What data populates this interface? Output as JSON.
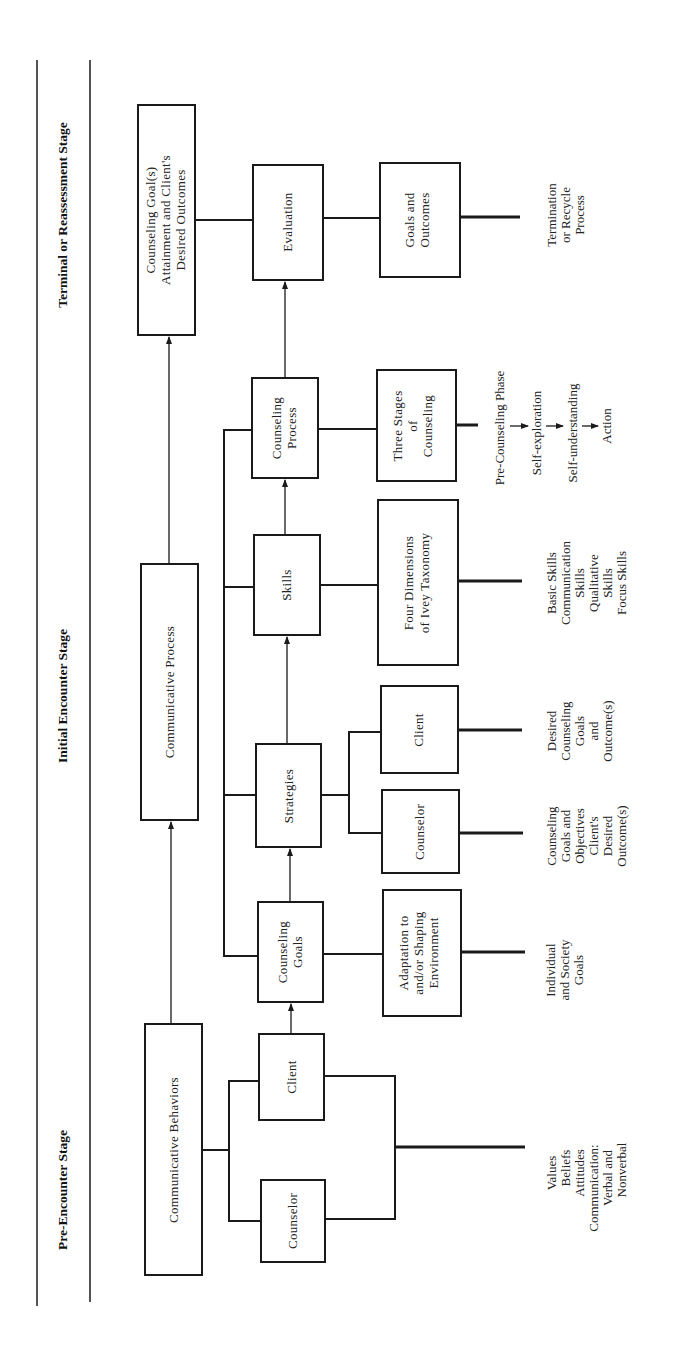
{
  "stages": {
    "pre_encounter": "Pre-Encounter Stage",
    "initial_encounter": "Initial Encounter Stage",
    "terminal": "Terminal or Reassessment Stage"
  },
  "boxes": {
    "communicative_behaviors": [
      "Communicative Behaviors"
    ],
    "pre_counselor": [
      "Counselor"
    ],
    "pre_client": [
      "Client"
    ],
    "communicative_process": [
      "Communicative Process"
    ],
    "counseling_goals": [
      "Counseling",
      "Goals"
    ],
    "adaptation": [
      "Adaptation to",
      "and/or Shaping",
      "Environment"
    ],
    "strategies": [
      "Strategies"
    ],
    "strat_counselor": [
      "Counselor"
    ],
    "strat_client": [
      "Client"
    ],
    "skills": [
      "Skills"
    ],
    "four_dimensions": [
      "Four Dimensions",
      "of Ivey Taxonomy"
    ],
    "counseling_process": [
      "Counseling",
      "Process"
    ],
    "three_stages": [
      "Three Stages",
      "of",
      "Counseling"
    ],
    "goal_attainment": [
      "Counseling Goal(s)",
      "Attainment and Client's",
      "Desired Outcomes"
    ],
    "evaluation": [
      "Evaluation"
    ],
    "goals_outcomes": [
      "Goals and",
      "Outcomes"
    ]
  },
  "outputs": {
    "pre": [
      "Values",
      "Beliefs",
      "Attitudes",
      "Communication:",
      "Verbal and",
      "Nonverbal"
    ],
    "goals": [
      "Individual",
      "and Society",
      "Goals"
    ],
    "strat_counselor": [
      "Counseling",
      "Goals and",
      "Objectives",
      "Client's",
      "Desired",
      "Outcome(s)"
    ],
    "strat_client": [
      "Desired",
      "Counseling",
      "Goals",
      "and",
      "Outcome(s)"
    ],
    "skills": [
      "Basic Skills",
      "Communication",
      "Skills",
      "Qualitative",
      "Skills",
      "Focus Skills"
    ],
    "stages_sequence": [
      "Pre-Counseling Phase",
      "Self-exploration",
      "Self-understanding",
      "Action"
    ],
    "terminal": [
      "Termination",
      "or Recycle",
      "Process"
    ]
  }
}
